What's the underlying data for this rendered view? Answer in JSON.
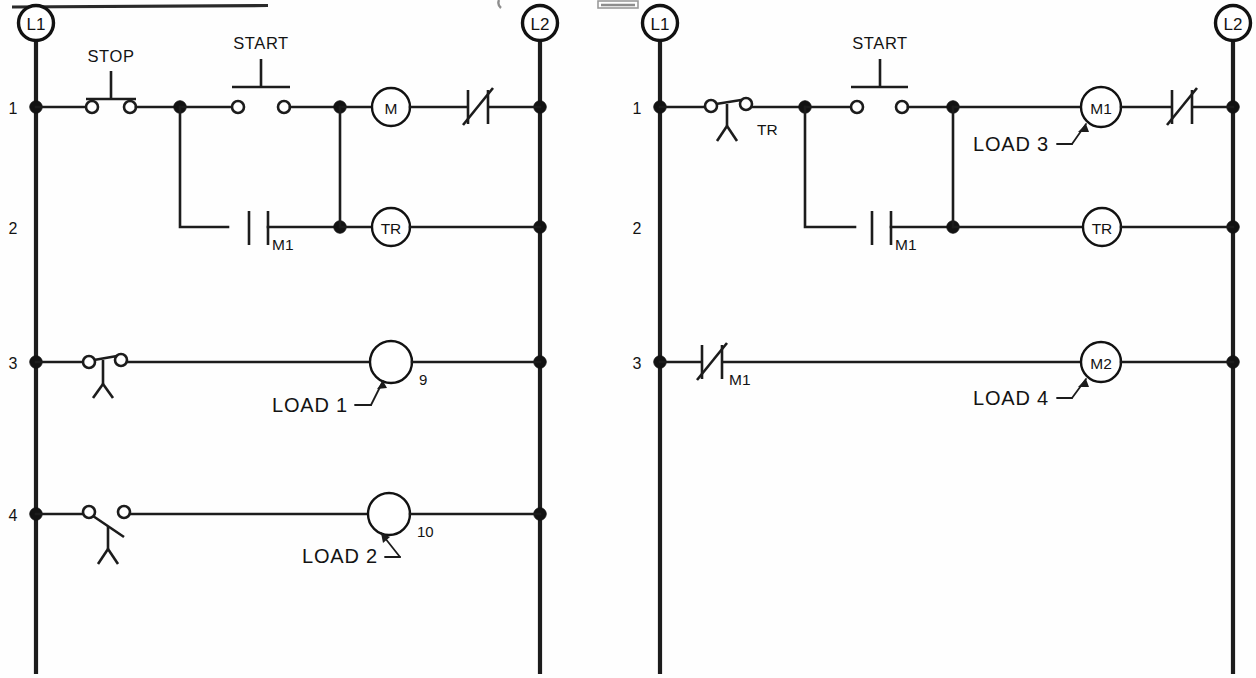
{
  "document": {
    "kind": "ladder-logic-diagram",
    "panel_count": 2,
    "line_color": "#1c1c1c",
    "background": "#ffffff"
  },
  "panels": [
    {
      "id": "left-circuit",
      "left_rail_label": "L1",
      "right_rail_label": "L2",
      "rungs": [
        {
          "number": "1",
          "contacts": [
            {
              "name": "STOP",
              "type": "pushbutton-normally-closed",
              "label": "STOP"
            },
            {
              "name": "START",
              "type": "pushbutton-normally-open",
              "label": "START"
            }
          ],
          "output": {
            "name": "M",
            "type": "coil",
            "label": "M"
          },
          "after_output": {
            "name": "overload",
            "type": "normally-closed-overload",
            "label": ""
          }
        },
        {
          "number": "2",
          "contacts": [
            {
              "name": "M1",
              "type": "normally-open-contact",
              "label": "M1"
            }
          ],
          "output": {
            "name": "TR",
            "type": "timer-coil",
            "label": "TR"
          },
          "after_output": null
        },
        {
          "number": "3",
          "contacts": [
            {
              "name": "limit-switch-nc",
              "type": "limit-switch-normally-closed",
              "label": ""
            }
          ],
          "output": {
            "name": "LOAD 1",
            "type": "load",
            "label": "",
            "callout": "LOAD 1",
            "number": "9"
          },
          "after_output": null
        },
        {
          "number": "4",
          "contacts": [
            {
              "name": "limit-switch-no",
              "type": "limit-switch-normally-open",
              "label": ""
            }
          ],
          "output": {
            "name": "LOAD 2",
            "type": "load",
            "label": "",
            "callout": "LOAD 2",
            "number": "10"
          },
          "after_output": null
        }
      ]
    },
    {
      "id": "right-circuit",
      "left_rail_label": "L1",
      "right_rail_label": "L2",
      "rungs": [
        {
          "number": "1",
          "contacts": [
            {
              "name": "TR",
              "type": "timed-contact-normally-closed",
              "label": "TR"
            },
            {
              "name": "START",
              "type": "pushbutton-normally-open",
              "label": "START"
            }
          ],
          "output": {
            "name": "M1",
            "type": "coil",
            "label": "M1",
            "callout": "LOAD 3"
          },
          "after_output": {
            "name": "overload",
            "type": "normally-closed-overload",
            "label": ""
          }
        },
        {
          "number": "2",
          "contacts": [
            {
              "name": "M1",
              "type": "normally-open-contact",
              "label": "M1"
            }
          ],
          "output": {
            "name": "TR",
            "type": "timer-coil",
            "label": "TR"
          },
          "after_output": null
        },
        {
          "number": "3",
          "contacts": [
            {
              "name": "M1",
              "type": "normally-closed-contact",
              "label": "M1"
            }
          ],
          "output": {
            "name": "M2",
            "type": "coil",
            "label": "M2",
            "callout": "LOAD 4"
          },
          "after_output": null
        }
      ]
    }
  ],
  "labels": {
    "L1": "L1",
    "L2": "L2",
    "STOP": "STOP",
    "START": "START",
    "M": "M",
    "M1": "M1",
    "M2": "M2",
    "TR": "TR",
    "LOAD1": "LOAD 1",
    "LOAD2": "LOAD 2",
    "LOAD3": "LOAD 3",
    "LOAD4": "LOAD 4",
    "num9": "9",
    "num10": "10",
    "rung1": "1",
    "rung2": "2",
    "rung3": "3",
    "rung4": "4"
  }
}
